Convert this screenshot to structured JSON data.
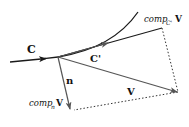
{
  "diagram": {
    "colors": {
      "curve": "#1a1a1a",
      "vector": "#555555",
      "dotted": "#333333",
      "text": "#111111",
      "background": "#ffffff"
    },
    "labels": {
      "curve": "C",
      "tangent": "C'",
      "normal": "n",
      "vector": "V",
      "comp_c_prefix": "comp",
      "comp_c_sub": "C'",
      "comp_c_vec": "V",
      "comp_n_prefix": "comp",
      "comp_n_sub": "n",
      "comp_n_vec": "V"
    },
    "points": {
      "origin": [
        58,
        57
      ],
      "comp_c_end": [
        162,
        28
      ],
      "v_end": [
        178,
        92
      ],
      "comp_n_end": [
        72,
        110
      ]
    }
  }
}
